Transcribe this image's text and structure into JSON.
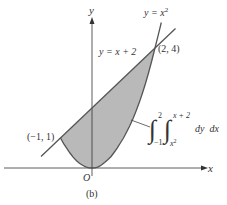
{
  "figure": {
    "caption": "(b)",
    "axes": {
      "x_label": "x",
      "y_label": "y",
      "origin_label": "O"
    },
    "curves": {
      "parabola": {
        "label_prefix": "y = x",
        "label_exp": "2"
      },
      "line": {
        "label": "y = x + 2"
      }
    },
    "points": {
      "upper": {
        "label": "(2, 4)"
      },
      "lower": {
        "label": "(−1, 1)"
      }
    },
    "integral": {
      "outer_upper": "2",
      "outer_lower": "−1",
      "inner_upper": "x + 2",
      "inner_lower_base": "x",
      "inner_lower_exp": "2",
      "differentials": "dy  dx"
    },
    "colors": {
      "fill": "#b9b9b9",
      "stroke": "#555555",
      "axis": "#333333"
    }
  }
}
